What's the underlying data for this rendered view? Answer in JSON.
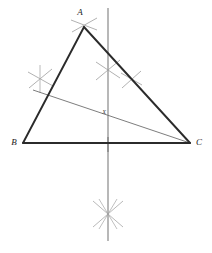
{
  "figure": {
    "background_color": "#ffffff",
    "width": 212,
    "height": 253
  },
  "labels": {
    "vertex_a": "A",
    "vertex_b": "B",
    "vertex_c": "C",
    "point_x": "X"
  },
  "colors": {
    "triangle_stroke": "#2b2b2b",
    "construction_line": "#8c8c8c",
    "arc_mark": "#a8a8a8",
    "cevian_line": "#6e6e6e",
    "label_text": "#1a1a1a"
  },
  "geometry": {
    "vertices": {
      "A": {
        "x": 84,
        "y": 27
      },
      "B": {
        "x": 23,
        "y": 143
      },
      "C": {
        "x": 190,
        "y": 143
      }
    },
    "perpendicular_bisector": {
      "x": 108,
      "y_top": 8,
      "y_bottom": 241
    },
    "cevian": {
      "x1": 40,
      "y1": 92,
      "x2": 190,
      "y2": 143
    },
    "intersection_point": {
      "x": 108,
      "y": 111
    },
    "base_tick": {
      "x": 108,
      "y": 143
    },
    "arc_marks": [
      {
        "name": "arc-cross-apex-a",
        "cx": 84,
        "cy": 25,
        "r": 13,
        "angle": 22
      },
      {
        "name": "arc-cross-left-side",
        "cx": 40,
        "cy": 79,
        "r": 13,
        "angle": 16
      },
      {
        "name": "arc-cross-side-ac",
        "cx": 108,
        "cy": 70,
        "r": 13,
        "angle": 20
      },
      {
        "name": "arc-cross-side-ac-lower",
        "cx": 131,
        "cy": 79,
        "r": 11,
        "angle": 20
      },
      {
        "name": "arc-cross-below-base",
        "cx": 108,
        "cy": 214,
        "r": 15,
        "angle": 25
      }
    ]
  }
}
